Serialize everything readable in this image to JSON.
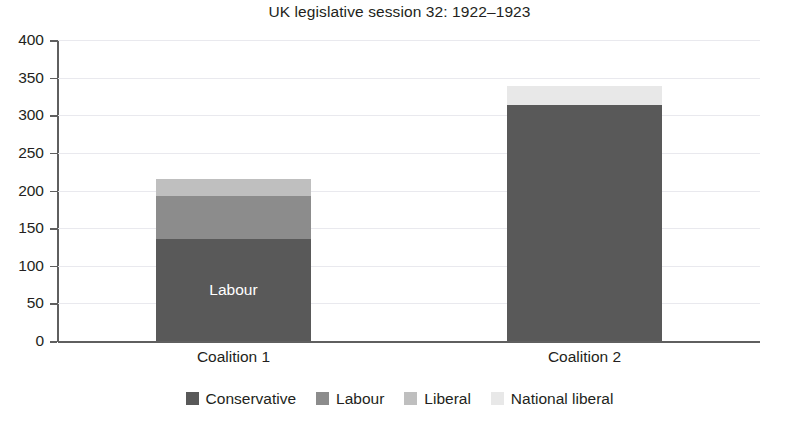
{
  "chart_data": {
    "type": "bar",
    "subtype": "stacked-bar",
    "title": "UK legislative session 32: 1922–1923",
    "xlabel": "",
    "ylabel": "",
    "categories": [
      "Coalition 1",
      "Coalition 2"
    ],
    "series": [
      {
        "name": "Conservative",
        "color": "#595959",
        "values": [
          136,
          314
        ]
      },
      {
        "name": "Labour",
        "color": "#8c8c8c",
        "values": [
          57,
          0
        ]
      },
      {
        "name": "Liberal",
        "color": "#bfbfbf",
        "values": [
          22,
          0
        ]
      },
      {
        "name": "National liberal",
        "color": "#e8e8e8",
        "values": [
          0,
          25
        ]
      }
    ],
    "totals": [
      215,
      339
    ],
    "ylim": [
      0,
      400
    ],
    "ytick_step": 50,
    "yticks": [
      "400",
      "350",
      "300",
      "250",
      "200",
      "150",
      "100",
      "50",
      "0"
    ],
    "grid": true,
    "legend_position": "bottom",
    "annotations": [
      {
        "text": "Labour",
        "series": "Conservative",
        "category": "Coalition 1",
        "color": "#ffffff"
      }
    ]
  },
  "legend": {
    "items": [
      {
        "label": "Conservative",
        "color": "#595959"
      },
      {
        "label": "Labour",
        "color": "#8c8c8c"
      },
      {
        "label": "Liberal",
        "color": "#bfbfbf"
      },
      {
        "label": "National liberal",
        "color": "#e8e8e8"
      }
    ]
  }
}
